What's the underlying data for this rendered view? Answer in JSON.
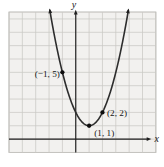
{
  "chart_data": {
    "type": "line",
    "function": "y = (x - 1)^2 + 1",
    "equation": {
      "a": 1,
      "h": 1,
      "k": 1
    },
    "x_plot_range": [
      -1.94,
      3.94
    ],
    "points": [
      {
        "x": -1,
        "y": 5,
        "label": "(−1, 5)",
        "label_side": "left"
      },
      {
        "x": 1,
        "y": 1,
        "label": "(1, 1)",
        "label_side": "below-right"
      },
      {
        "x": 2,
        "y": 2,
        "label": "(2, 2)",
        "label_side": "right"
      }
    ],
    "xlabel": "x",
    "ylabel": "y",
    "grid": true,
    "x_visible_range": [
      -5,
      6
    ],
    "y_visible_range": [
      -1,
      9.5
    ],
    "legend": "none"
  },
  "colors": {
    "page_bg": "#ffffff",
    "grid_bg": "#f2f1ef",
    "grid_line": "#c9c8c4",
    "grid_border": "#b3b2ae",
    "axis": "#1f1f1f",
    "curve": "#2d2d2d",
    "point": "#0e0e0e",
    "label": "#141414"
  }
}
